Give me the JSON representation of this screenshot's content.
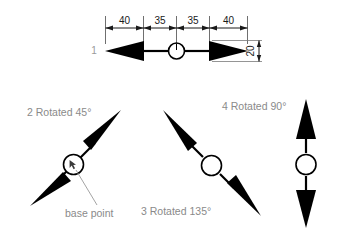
{
  "diagram": {
    "title_text": "",
    "background_color": "#ffffff",
    "ink_color": "#000000",
    "label_color": "#8a8a8a",
    "dim_color": "#1a1a1a",
    "figures": [
      {
        "id": "1",
        "id_label": "1",
        "rotation_label": "",
        "orientation": "horizontal",
        "angle_degrees": 0
      },
      {
        "id": "2",
        "id_label": "",
        "rotation_label": "2 Rotated 45°",
        "orientation": "diagonal-up-right",
        "angle_degrees": 45
      },
      {
        "id": "3",
        "id_label": "",
        "rotation_label": "3 Rotated 135°",
        "orientation": "diagonal-up-left",
        "angle_degrees": 135
      },
      {
        "id": "4",
        "id_label": "",
        "rotation_label": "4 Rotated 90°",
        "orientation": "vertical",
        "angle_degrees": 90
      }
    ],
    "dimensions": [
      {
        "value": "40",
        "span": "left-arrowhead-length"
      },
      {
        "value": "35",
        "span": "left-shaft-length"
      },
      {
        "value": "35",
        "span": "right-shaft-length"
      },
      {
        "value": "40",
        "span": "right-arrowhead-length"
      },
      {
        "value": "20",
        "span": "arrowhead-half-height",
        "orientation": "vertical"
      }
    ],
    "callouts": [
      {
        "text": "base point",
        "points_to": "circle-center-of-figure-2"
      }
    ]
  }
}
